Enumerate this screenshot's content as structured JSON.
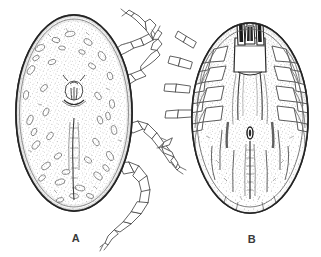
{
  "figure": {
    "kind": "scientific-line-drawing",
    "background_color": "#ffffff",
    "ink_color": "#2b2b2b",
    "stipple_color": "#4a4a4a",
    "width": 321,
    "height": 257,
    "panels": [
      {
        "id": "A",
        "label": "A",
        "view": "dorsal",
        "description": "Engorged tick in dorsal view with stippled, leathery cuticle and four legs extending to the right side",
        "label_position": {
          "x": 76,
          "y": 238
        },
        "body": {
          "center_x": 74,
          "center_y": 113,
          "radius_x": 58,
          "radius_y": 98,
          "outline_thickness": 2
        },
        "features": [
          {
            "name": "capitulum",
            "x": 74,
            "y": 93
          },
          {
            "name": "dorsal-groove",
            "x": 74,
            "y": 160
          },
          {
            "name": "cuticle-stipple",
            "x": 74,
            "y": 113
          }
        ],
        "legs": [
          {
            "name": "leg-I",
            "segments": 6
          },
          {
            "name": "leg-II",
            "segments": 6
          },
          {
            "name": "leg-III",
            "segments": 6
          },
          {
            "name": "leg-IV",
            "segments": 6
          }
        ]
      },
      {
        "id": "B",
        "label": "B",
        "view": "ventral",
        "description": "Engorged tick in ventral view showing capitulum with hypostome and palps, coxae, genital aperture and ventral grooves",
        "label_position": {
          "x": 252,
          "y": 240
        },
        "body": {
          "center_x": 250,
          "center_y": 118,
          "radius_x": 58,
          "radius_y": 95,
          "outline_thickness": 2
        },
        "features": [
          {
            "name": "capitulum",
            "x": 250,
            "y": 38
          },
          {
            "name": "hypostome",
            "x": 250,
            "y": 32
          },
          {
            "name": "palp-left",
            "x": 243,
            "y": 30
          },
          {
            "name": "palp-right",
            "x": 257,
            "y": 30
          },
          {
            "name": "basis-capituli",
            "x": 250,
            "y": 55
          },
          {
            "name": "genital-aperture",
            "x": 250,
            "y": 133
          },
          {
            "name": "median-ventral-groove",
            "x": 250,
            "y": 170
          },
          {
            "name": "coxae-left",
            "x": 215,
            "y": 95
          },
          {
            "name": "coxae-right",
            "x": 285,
            "y": 95
          }
        ],
        "legs": [
          {
            "name": "leg-I",
            "segments": 5
          },
          {
            "name": "leg-II",
            "segments": 5
          },
          {
            "name": "leg-III",
            "segments": 5
          },
          {
            "name": "leg-IV",
            "segments": 5
          }
        ]
      }
    ]
  }
}
